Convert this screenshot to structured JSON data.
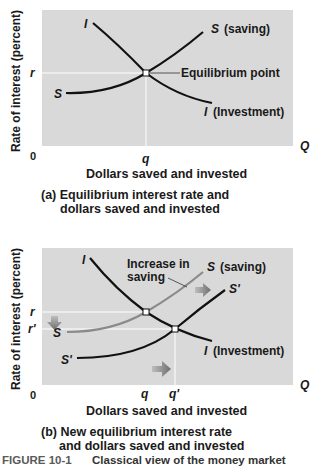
{
  "panel_a": {
    "y_axis_label": "Rate of interest (percent)",
    "x_axis_label": "Dollars saved and invested",
    "origin_label": "0",
    "x_end_label": "Q",
    "r_label": "r",
    "q_label": "q",
    "curve_I_label": "I",
    "curve_I_full": "(Investment)",
    "curve_S_label": "S",
    "curve_S_full": "(saving)",
    "equilibrium_label": "Equilibrium point",
    "caption_line1": "(a) Equilibrium interest rate and",
    "caption_line2": "dollars saved and invested"
  },
  "panel_b": {
    "y_axis_label": "Rate of interest (percent)",
    "x_axis_label": "Dollars saved and invested",
    "origin_label": "0",
    "x_end_label": "Q",
    "r_label": "r",
    "r_prime_label": "r'",
    "q_label": "q",
    "q_prime_label": "q'",
    "curve_I_label": "I",
    "curve_I_full": "(Investment)",
    "curve_S_label": "S",
    "curve_S_full": "(saving)",
    "curve_S_prime_label": "S'",
    "annotation_line1": "Increase in",
    "annotation_line2": "saving",
    "caption_line1": "(b) New equilibrium interest rate",
    "caption_line2": "and dollars saved and invested"
  },
  "figure": {
    "number": "FIGURE 10-1",
    "title": "Classical view of the money market"
  },
  "colors": {
    "plot_bg": "#d9d9d9",
    "curve": "#111111",
    "old_saving_curve": "#8a8a8a",
    "arrow": "#7a7a7a",
    "guide": "#ffffff"
  }
}
